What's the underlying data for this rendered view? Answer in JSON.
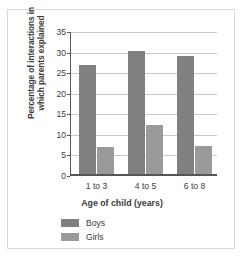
{
  "chart_data": {
    "type": "bar",
    "title": "",
    "categories": [
      "1 to 3",
      "4 to 5",
      "6 to 8"
    ],
    "series": [
      {
        "name": "Boys",
        "values": [
          27.0,
          30.3,
          29.2
        ],
        "color": "#808080"
      },
      {
        "name": "Girls",
        "values": [
          7.0,
          12.3,
          7.2
        ],
        "color": "#9a9a9a"
      }
    ],
    "xlabel": "Age of child (years)",
    "ylabel": "Percentage of interactions in which parents explained",
    "ylabel_lines": [
      "Percentage of interactions in",
      "which parents explained"
    ],
    "ylim": [
      0,
      35
    ],
    "ytick_step": 5,
    "yticks": [
      "35",
      "30",
      "25",
      "20",
      "15",
      "10",
      "5",
      "0"
    ],
    "grid": true,
    "legend_position": "bottom-left"
  },
  "legend": {
    "items": [
      {
        "label": "Boys",
        "color": "#808080"
      },
      {
        "label": "Girls",
        "color": "#9a9a9a"
      }
    ]
  },
  "axes": {
    "x_title": "Age of child (years)",
    "y_title_line1": "Percentage of interactions in",
    "y_title_line2": "which parents explained"
  }
}
